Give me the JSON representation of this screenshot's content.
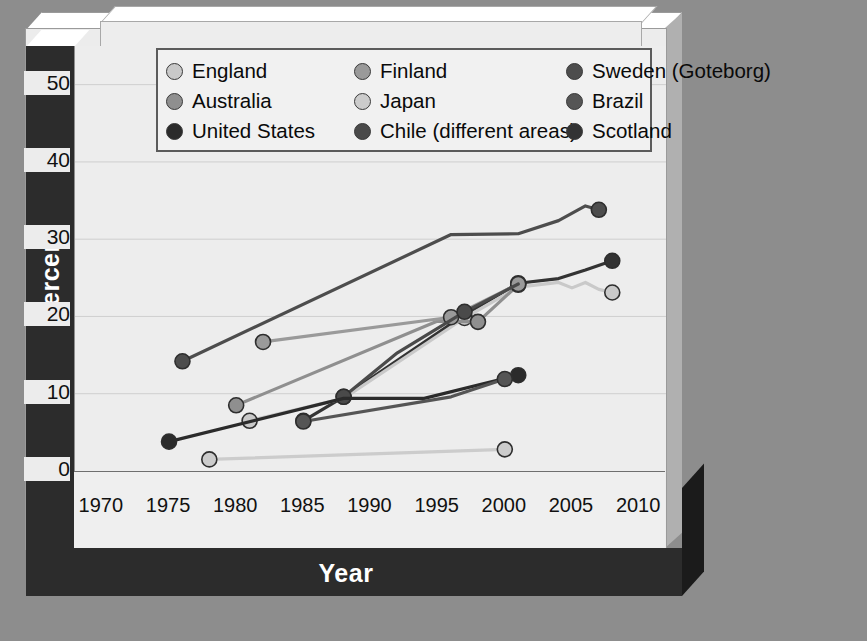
{
  "axis": {
    "ylabel": "Percent",
    "xlabel": "Year",
    "yticks": [
      "0",
      "10",
      "20",
      "30",
      "40",
      "50"
    ],
    "xticks": [
      "1970",
      "1975",
      "1980",
      "1985",
      "1990",
      "1995",
      "2000",
      "2005",
      "2010"
    ]
  },
  "legend": {
    "items": [
      {
        "label": "England",
        "color": "#c9c9c9"
      },
      {
        "label": "Finland",
        "color": "#9a9a9a"
      },
      {
        "label": "Sweden (Goteborg)",
        "color": "#4d4d4d"
      },
      {
        "label": "Australia",
        "color": "#8f8f8f"
      },
      {
        "label": "Japan",
        "color": "#cccccc"
      },
      {
        "label": "Brazil",
        "color": "#555555"
      },
      {
        "label": "United States",
        "color": "#2b2b2b"
      },
      {
        "label": "Chile (different areas)",
        "color": "#4a4a4a"
      },
      {
        "label": "Scotland",
        "color": "#333333"
      }
    ]
  },
  "chart_data": {
    "type": "line",
    "title": "",
    "xlabel": "Year",
    "ylabel": "Percent",
    "xlim": [
      1968,
      2012
    ],
    "ylim": [
      0,
      55
    ],
    "yticks": [
      0,
      10,
      20,
      30,
      40,
      50
    ],
    "xticks": [
      1970,
      1975,
      1980,
      1985,
      1990,
      1995,
      2000,
      2005,
      2010
    ],
    "grid": true,
    "legend_position": "top",
    "series": [
      {
        "name": "Sweden (Goteborg)",
        "color": "#4d4d4d",
        "x": [
          1976,
          1996,
          2001,
          2004,
          2006,
          2007
        ],
        "y": [
          14.2,
          30.6,
          30.7,
          32.4,
          34.3,
          33.8
        ],
        "markers": [
          1976,
          2007
        ]
      },
      {
        "name": "Scotland",
        "color": "#333333",
        "x": [
          1985,
          1988,
          1997,
          2001,
          2004,
          2006,
          2008
        ],
        "y": [
          6.5,
          9.6,
          20.2,
          24.3,
          24.9,
          26.0,
          27.2
        ],
        "markers": [
          1985,
          1988,
          1997,
          2001,
          2008
        ]
      },
      {
        "name": "England",
        "color": "#c9c9c9",
        "x": [
          1981,
          1988,
          1997,
          2001,
          2004,
          2005,
          2006,
          2007,
          2008
        ],
        "y": [
          6.5,
          9.4,
          19.8,
          23.8,
          24.4,
          23.7,
          24.4,
          23.5,
          23.1
        ],
        "markers": [
          1981,
          1997,
          2008
        ]
      },
      {
        "name": "Australia",
        "color": "#8f8f8f",
        "x": [
          1980,
          1995,
          1998,
          2001
        ],
        "y": [
          8.5,
          19.4,
          19.3,
          24.1
        ],
        "markers": [
          1980,
          1998,
          2001
        ]
      },
      {
        "name": "Finland",
        "color": "#9a9a9a",
        "x": [
          1982,
          1996,
          2001
        ],
        "y": [
          16.7,
          19.9,
          24.2
        ],
        "markers": [
          1982,
          1996,
          2001
        ]
      },
      {
        "name": "Chile (different areas)",
        "color": "#4a4a4a",
        "x": [
          1988,
          1992,
          1997,
          2001
        ],
        "y": [
          9.6,
          15.3,
          20.6,
          24.2
        ],
        "markers": [
          1988,
          1997
        ]
      },
      {
        "name": "United States",
        "color": "#2b2b2b",
        "x": [
          1975,
          1988,
          1994,
          2001
        ],
        "y": [
          3.8,
          9.4,
          9.4,
          12.4
        ],
        "markers": [
          1975,
          2001
        ]
      },
      {
        "name": "Brazil",
        "color": "#555555",
        "x": [
          1985,
          1996,
          2000
        ],
        "y": [
          6.4,
          9.6,
          11.9
        ],
        "markers": [
          1985,
          2000
        ]
      },
      {
        "name": "Japan",
        "color": "#cccccc",
        "x": [
          1978,
          2000
        ],
        "y": [
          1.5,
          2.8
        ],
        "markers": [
          1978,
          2000
        ]
      }
    ]
  }
}
